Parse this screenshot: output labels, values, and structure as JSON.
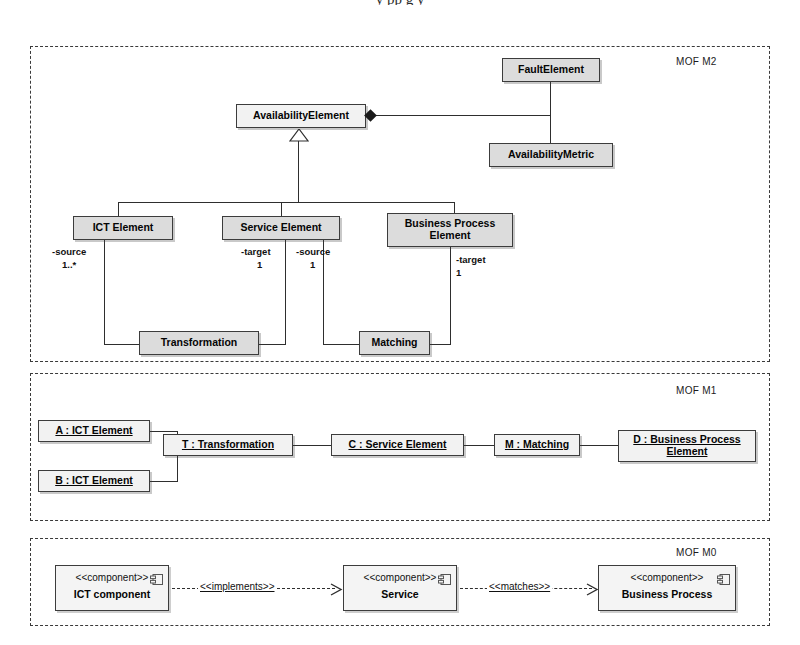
{
  "caption": "y pp g y",
  "layers": [
    {
      "id": "m2",
      "label": "MOF M2"
    },
    {
      "id": "m1",
      "label": "MOF M1"
    },
    {
      "id": "m0",
      "label": "MOF M0"
    }
  ],
  "m2": {
    "label": "MOF M2",
    "classes": {
      "fault_element": "FaultElement",
      "availability_metric": "AvailabilityMetric",
      "availability_element": "AvailabilityElement",
      "ict_element": "ICT Element",
      "service_element": "Service Element",
      "business_process_element": "Business Process\nElement",
      "business_process_element_line1": "Business Process",
      "business_process_element_line2": "Element",
      "transformation": "Transformation",
      "matching": "Matching"
    },
    "roles": {
      "ict_source_name": "-source",
      "ict_source_mult": "1..*",
      "service_target_name": "-target",
      "service_target_mult": "1",
      "service_source_name": "-source",
      "service_source_mult": "1",
      "bpe_target_name": "-target",
      "bpe_target_mult": "1"
    }
  },
  "m1": {
    "label": "MOF M1",
    "objects": {
      "a_ict": "A : ICT Element",
      "b_ict": "B : ICT Element",
      "t_transformation": "T : Transformation",
      "c_service": "C : Service Element",
      "m_matching": "M : Matching",
      "d_bp_line1": "D : Business Process",
      "d_bp_line2": "Element"
    }
  },
  "m0": {
    "label": "MOF M0",
    "components": [
      {
        "stereotype": "<<component>>",
        "name": "ICT component",
        "icon": "component-icon"
      },
      {
        "stereotype": "<<component>>",
        "name": "Service",
        "icon": "component-icon"
      },
      {
        "stereotype": "<<component>>",
        "name": "Business Process",
        "icon": "component-icon"
      }
    ],
    "dependencies": [
      {
        "label": "<<implements>>"
      },
      {
        "label": "<<matches>>"
      }
    ]
  },
  "colors": {
    "node_fill": "#e3e3e3",
    "node_fill_light": "#f2f2f2",
    "stroke": "#3c3c3c",
    "edge": "#2e2e2e",
    "background": "#ffffff"
  }
}
